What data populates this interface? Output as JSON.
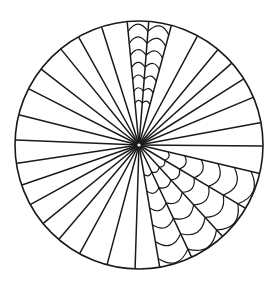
{
  "figure": {
    "colors": {
      "background": "#ffffff",
      "stroke": "#1a1a1a"
    },
    "center": [
      139,
      145
    ],
    "radius": 123,
    "spoke_rim_points": [
      [
        127,
        20
      ],
      [
        149,
        18
      ],
      [
        172,
        23
      ],
      [
        199,
        33
      ],
      [
        220,
        47
      ],
      [
        233,
        62
      ],
      [
        245,
        78
      ],
      [
        254,
        97
      ],
      [
        259,
        123
      ],
      [
        262,
        146
      ],
      [
        258,
        173
      ],
      [
        245,
        208
      ],
      [
        223,
        237
      ],
      [
        192,
        258
      ],
      [
        160,
        269
      ],
      [
        135,
        271
      ],
      [
        107,
        265
      ],
      [
        80,
        253
      ],
      [
        60,
        238
      ],
      [
        45,
        222
      ],
      [
        33,
        203
      ],
      [
        25,
        184
      ],
      [
        19,
        163
      ],
      [
        17,
        140
      ],
      [
        20,
        115
      ],
      [
        29,
        89
      ],
      [
        41,
        69
      ],
      [
        60,
        48
      ],
      [
        78,
        36
      ],
      [
        101,
        25
      ]
    ],
    "web_sectors": [
      {
        "name": "top-web",
        "spoke_range": [
          0,
          2
        ],
        "start_radius": 42,
        "step": 12,
        "bulge": 1.12
      },
      {
        "name": "lower-right-web",
        "spoke_range": [
          10,
          14
        ],
        "start_radius": 30,
        "step": 17,
        "bulge": 1.14
      }
    ]
  }
}
